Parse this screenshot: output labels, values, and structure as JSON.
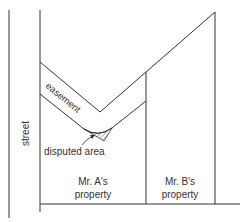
{
  "diagram": {
    "labels": {
      "street": "street",
      "easement": "easement",
      "disputed_area": "disputed area",
      "property_a_line1": "Mr. A's",
      "property_a_line2": "property",
      "property_b_line1": "Mr. B's",
      "property_b_line2": "property"
    },
    "colors": {
      "line": "#333333",
      "text": "#333333"
    }
  }
}
